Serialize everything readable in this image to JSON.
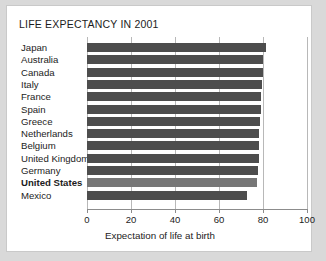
{
  "chart_data": {
    "type": "bar",
    "orientation": "horizontal",
    "title": "LIFE EXPECTANCY IN 2001",
    "xlabel": "Expectation of life at birth",
    "ylabel": "",
    "xlim": [
      0,
      100
    ],
    "xticks": [
      0,
      20,
      40,
      60,
      80,
      100
    ],
    "xtick_labels": [
      "0",
      "20",
      "40",
      "60",
      "80",
      "100"
    ],
    "grid": true,
    "legend": null,
    "categories": [
      "Japan",
      "Australia",
      "Canada",
      "Italy",
      "France",
      "Spain",
      "Greece",
      "Netherlands",
      "Belgium",
      "United Kingdom",
      "Germany",
      "United States",
      "Mexico"
    ],
    "values": [
      81.5,
      80.0,
      79.8,
      79.5,
      79.1,
      79.0,
      78.6,
      78.4,
      78.2,
      78.0,
      77.8,
      77.3,
      72.5
    ],
    "highlight_category": "United States",
    "colors": {
      "bar": "#4d4d4d",
      "bar_highlight": "#777777",
      "grid": "#b8b8b8",
      "axis": "#8c8c8c",
      "text": "#1c1c1c",
      "figure_background": "#ffffff",
      "page_background": "#d9d9d9"
    }
  }
}
